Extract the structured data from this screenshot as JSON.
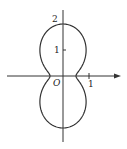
{
  "chart_data": {
    "type": "polar-curve",
    "title": "",
    "curve": "closed symmetric polar curve, r(0)=0.5, r(pi/2)=2",
    "r_at_theta_0": 0.5,
    "r_at_theta_pi_2": 2,
    "axes": {
      "x_arrow": true,
      "y_arrow": false,
      "grid": false
    },
    "labels": {
      "origin": "O",
      "x_tick": "1",
      "y_tick_1": "1",
      "y_tick_2": "2"
    }
  },
  "geometry": {
    "origin_x": 63,
    "origin_y": 76,
    "unit": 26,
    "stroke": "#333333"
  }
}
